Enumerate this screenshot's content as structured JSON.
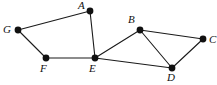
{
  "figure": {
    "kind": "undirected-graph-diagram",
    "width": 217,
    "height": 85,
    "background_color": "#ffffff",
    "stroke_color": "#1a1a1a",
    "vertex_color": "#111111",
    "label_color": "#111111"
  },
  "chart_data": {
    "type": "diagram",
    "title": "",
    "xlabel": "",
    "ylabel": "",
    "nodes": [
      {
        "id": "A",
        "label": "A",
        "x": 90,
        "y": 11,
        "r": 3.4,
        "label_x": 78,
        "label_y": 0,
        "label_pos": "above-left"
      },
      {
        "id": "B",
        "label": "B",
        "x": 140,
        "y": 30,
        "r": 3.4,
        "label_x": 128,
        "label_y": 14,
        "label_pos": "above-left"
      },
      {
        "id": "C",
        "label": "C",
        "x": 203,
        "y": 39,
        "r": 3.4,
        "label_x": 209,
        "label_y": 34,
        "label_pos": "right"
      },
      {
        "id": "D",
        "label": "D",
        "x": 172,
        "y": 68,
        "r": 3.4,
        "label_x": 167,
        "label_y": 72,
        "label_pos": "below"
      },
      {
        "id": "E",
        "label": "E",
        "x": 95,
        "y": 58,
        "r": 3.4,
        "label_x": 89,
        "label_y": 63,
        "label_pos": "below"
      },
      {
        "id": "F",
        "label": "F",
        "x": 46,
        "y": 58,
        "r": 3.4,
        "label_x": 40,
        "label_y": 63,
        "label_pos": "below"
      },
      {
        "id": "G",
        "label": "G",
        "x": 18,
        "y": 30,
        "r": 3.4,
        "label_x": 3,
        "label_y": 24,
        "label_pos": "left"
      }
    ],
    "edges": [
      {
        "from": "G",
        "to": "A"
      },
      {
        "from": "A",
        "to": "E"
      },
      {
        "from": "G",
        "to": "F"
      },
      {
        "from": "F",
        "to": "E"
      },
      {
        "from": "E",
        "to": "B"
      },
      {
        "from": "E",
        "to": "D"
      },
      {
        "from": "B",
        "to": "C"
      },
      {
        "from": "B",
        "to": "D"
      },
      {
        "from": "C",
        "to": "D"
      }
    ],
    "node_count": 7,
    "edge_count": 9
  }
}
